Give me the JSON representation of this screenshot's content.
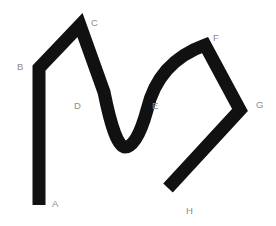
{
  "figure": {
    "background_color": "#ffffff",
    "stroke_color": "#111111",
    "stroke_width": 13,
    "label_color": "#8a8a8a",
    "canvas": {
      "width": 276,
      "height": 226
    }
  },
  "path": {
    "description": "Thick black path starting at A, going up to B, diagonally up to peak C, curving down through D into a U-bottom, rising through E up to peak F, then down-right to G, then down-left to endpoint H.",
    "segments": [
      {
        "id": "A-B",
        "type": "line",
        "from": "A",
        "to": "B"
      },
      {
        "id": "B-C",
        "type": "line",
        "from": "B",
        "to": "C"
      },
      {
        "id": "C-D-E",
        "type": "curve",
        "from": "C",
        "through": [
          "D",
          "U-bottom"
        ],
        "to": "E"
      },
      {
        "id": "E-F",
        "type": "curve",
        "from": "E",
        "to": "F"
      },
      {
        "id": "F-G",
        "type": "line",
        "from": "F",
        "to": "G"
      },
      {
        "id": "G-H",
        "type": "line",
        "from": "G",
        "to": "H"
      }
    ],
    "d": "M 39 205 L 39 68 L 80 25 L 104 92 Q 115 147 125 147 Q 137 147 147 110 Q 158 62 205 45 L 240 110 L 168 188"
  },
  "labels": [
    {
      "id": "A",
      "text": "A",
      "x": 52,
      "y": 199,
      "anchor": "path-endpoint"
    },
    {
      "id": "B",
      "text": "B",
      "x": 17,
      "y": 62,
      "anchor": "path-vertex"
    },
    {
      "id": "C",
      "text": "C",
      "x": 91,
      "y": 18,
      "anchor": "path-vertex"
    },
    {
      "id": "D",
      "text": "D",
      "x": 74,
      "y": 101,
      "anchor": "path-point"
    },
    {
      "id": "E",
      "text": "E",
      "x": 152,
      "y": 101,
      "anchor": "path-point"
    },
    {
      "id": "F",
      "text": "F",
      "x": 213,
      "y": 33,
      "anchor": "path-vertex"
    },
    {
      "id": "G",
      "text": "G",
      "x": 256,
      "y": 100,
      "anchor": "path-vertex"
    },
    {
      "id": "H",
      "text": "H",
      "x": 186,
      "y": 206,
      "anchor": "path-endpoint"
    }
  ]
}
